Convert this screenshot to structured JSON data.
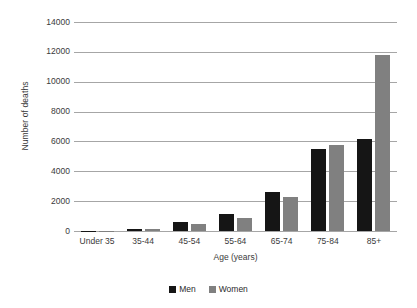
{
  "chart_data": {
    "type": "bar",
    "title": "",
    "subtitle": "",
    "xlabel": "Age (years)",
    "ylabel": "Number of deaths",
    "categories": [
      "Under 35",
      "35-44",
      "45-54",
      "55-64",
      "65-74",
      "75-84",
      "85+"
    ],
    "series": [
      {
        "name": "Men",
        "color": "#151515",
        "values": [
          20,
          160,
          600,
          1150,
          2600,
          5500,
          6150
        ]
      },
      {
        "name": "Women",
        "color": "#808080",
        "values": [
          15,
          110,
          470,
          870,
          2250,
          5750,
          11800
        ]
      }
    ],
    "ylim": [
      0,
      14000
    ],
    "yticks": [
      0,
      2000,
      4000,
      6000,
      8000,
      10000,
      12000,
      14000
    ],
    "ytick_labels": [
      "0",
      "2000",
      "4000",
      "6000",
      "8000",
      "10000",
      "12000",
      "14000"
    ],
    "grid": true,
    "grid_axis": "y",
    "grid_color": "#a6a6a6",
    "legend": [
      "Men",
      "Women"
    ],
    "legend_position": "bottom-center",
    "background": "#ffffff",
    "text_color": "#3a3a3a"
  }
}
